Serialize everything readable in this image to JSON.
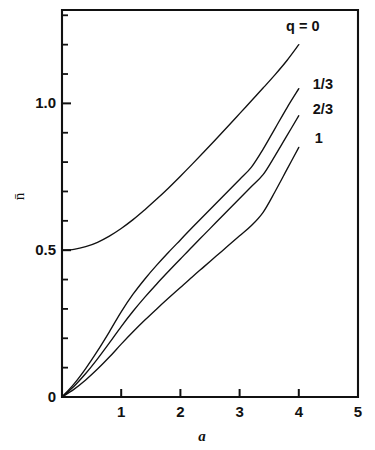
{
  "chart_data": {
    "type": "line",
    "title": "",
    "subtitle": "",
    "xlabel": "a",
    "ylabel": "n̄",
    "xlim": [
      0,
      5
    ],
    "ylim": [
      0,
      1.318
    ],
    "grid": false,
    "legend_position": "inline-right-of-curve-ends",
    "x_ticks_major": [
      0,
      1,
      2,
      3,
      4,
      5
    ],
    "x_tick_labels": [
      "",
      "1",
      "2",
      "3",
      "4",
      "5"
    ],
    "y_ticks_major": [
      0,
      0.5,
      1.0
    ],
    "y_tick_labels": [
      "0",
      "0.5",
      "1.0"
    ],
    "y_ticks_minor": [
      0.1,
      0.2,
      0.3,
      0.4,
      0.6,
      0.7,
      0.8,
      0.9,
      1.1,
      1.2,
      1.3
    ],
    "x": [
      0,
      0.2,
      0.4,
      0.6,
      0.8,
      1.0,
      1.2,
      1.4,
      1.6,
      1.8,
      2.0,
      2.2,
      2.4,
      2.6,
      2.8,
      3.0,
      3.2,
      3.4,
      3.6,
      3.8,
      4.0
    ],
    "series": [
      {
        "name": "q = 0",
        "label": "q = 0",
        "q_value": "0",
        "values": [
          0.5,
          0.503,
          0.512,
          0.527,
          0.548,
          0.574,
          0.604,
          0.638,
          0.674,
          0.712,
          0.752,
          0.793,
          0.835,
          0.878,
          0.921,
          0.965,
          1.009,
          1.053,
          1.098,
          1.146,
          1.2
        ]
      },
      {
        "name": "q = 1/3",
        "label": "1/3",
        "q_value": "1/3",
        "values": [
          0.0,
          0.044,
          0.097,
          0.157,
          0.222,
          0.29,
          0.35,
          0.402,
          0.449,
          0.493,
          0.535,
          0.577,
          0.618,
          0.659,
          0.7,
          0.741,
          0.783,
          0.845,
          0.915,
          0.985,
          1.05
        ]
      },
      {
        "name": "q = 2/3",
        "label": "2/3",
        "q_value": "2/3",
        "values": [
          0.0,
          0.036,
          0.08,
          0.13,
          0.184,
          0.24,
          0.292,
          0.34,
          0.385,
          0.428,
          0.47,
          0.512,
          0.553,
          0.594,
          0.635,
          0.676,
          0.717,
          0.758,
          0.822,
          0.89,
          0.958
        ]
      },
      {
        "name": "q = 1",
        "label": "1",
        "q_value": "1",
        "values": [
          0.0,
          0.026,
          0.058,
          0.095,
          0.136,
          0.18,
          0.222,
          0.262,
          0.3,
          0.337,
          0.373,
          0.409,
          0.444,
          0.479,
          0.514,
          0.549,
          0.584,
          0.63,
          0.7,
          0.775,
          0.85
        ]
      }
    ],
    "annotations": [
      {
        "text": "q = 0",
        "for_series": "q = 0"
      },
      {
        "text": "1/3",
        "for_series": "q = 1/3"
      },
      {
        "text": "2/3",
        "for_series": "q = 2/3"
      },
      {
        "text": "1",
        "for_series": "q = 1"
      }
    ],
    "colors": {
      "curve": "#111111",
      "axis": "#111111",
      "background": "#ffffff",
      "text": "#111111"
    }
  }
}
